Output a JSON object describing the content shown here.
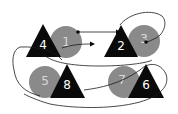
{
  "colors": {
    "background": "#ffffff",
    "triangle_fill": "#0a0a0a",
    "circle_fill": "#8a8a8a",
    "label_on_triangle": "#ffffff",
    "label_on_circle": "#d8d8d8",
    "path_stroke": "#1a1a1a"
  },
  "shapes": [
    {
      "id": "t4",
      "type": "triangle",
      "label": "4"
    },
    {
      "id": "c1",
      "type": "circle",
      "label": "1"
    },
    {
      "id": "t2",
      "type": "triangle",
      "label": "2"
    },
    {
      "id": "c3",
      "type": "circle",
      "label": "3"
    },
    {
      "id": "c5",
      "type": "circle",
      "label": "5"
    },
    {
      "id": "t8",
      "type": "triangle",
      "label": "8"
    },
    {
      "id": "c7",
      "type": "circle",
      "label": "7"
    },
    {
      "id": "t6",
      "type": "triangle",
      "label": "6"
    }
  ]
}
